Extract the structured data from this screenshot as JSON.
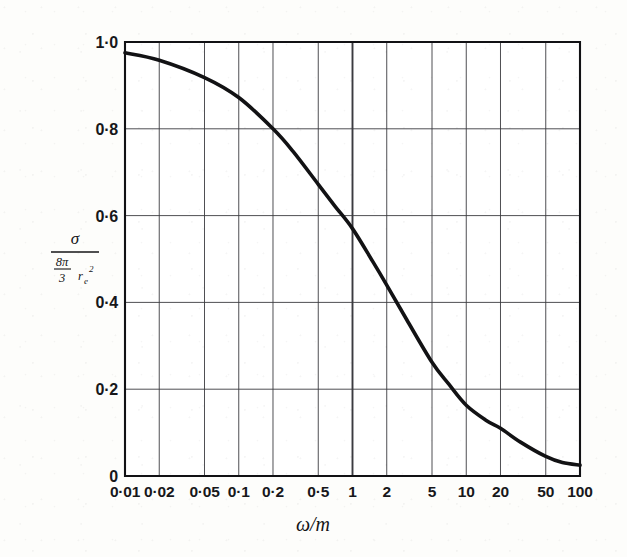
{
  "figure": {
    "background_color": "#fdfdfb",
    "ink_color": "#17171a",
    "curve_color": "#121214"
  },
  "axis_titles": {
    "x": "ω/m",
    "y_numerator": "σ",
    "y_denominator_frac_num": "8π",
    "y_denominator_frac_den": "3",
    "y_denominator_sym": "r",
    "y_denominator_sub": "e",
    "y_denominator_sup": "2"
  },
  "chart_data": {
    "type": "line",
    "title": "",
    "xlabel": "ω/m",
    "ylabel": "σ / ((8π/3) rₑ²)",
    "xscale": "log",
    "yscale": "linear",
    "xlim": [
      0.01,
      100
    ],
    "ylim": [
      0,
      1.0
    ],
    "grid": true,
    "legend": null,
    "x_ticks": [
      0.01,
      0.02,
      0.05,
      0.1,
      0.2,
      0.5,
      1,
      2,
      5,
      10,
      20,
      50,
      100
    ],
    "x_tick_labels": [
      "0·01",
      "0·02",
      "0·05",
      "0·1",
      "0·2",
      "0·5",
      "1",
      "2",
      "5",
      "10",
      "20",
      "50",
      "100"
    ],
    "y_ticks": [
      0,
      0.2,
      0.4,
      0.6,
      0.8,
      1.0
    ],
    "y_tick_labels": [
      "0",
      "0·2",
      "0·4",
      "0·6",
      "0·8",
      "1·0"
    ],
    "series": [
      {
        "name": "Klein-Nishina total cross-section ratio",
        "x": [
          0.01,
          0.02,
          0.05,
          0.1,
          0.2,
          0.3,
          0.5,
          0.7,
          1,
          1.5,
          2,
          3,
          5,
          7,
          10,
          15,
          20,
          30,
          50,
          70,
          100
        ],
        "y": [
          0.975,
          0.958,
          0.918,
          0.872,
          0.8,
          0.748,
          0.672,
          0.622,
          0.57,
          0.495,
          0.44,
          0.36,
          0.262,
          0.212,
          0.163,
          0.128,
          0.11,
          0.078,
          0.045,
          0.031,
          0.025
        ]
      }
    ]
  }
}
